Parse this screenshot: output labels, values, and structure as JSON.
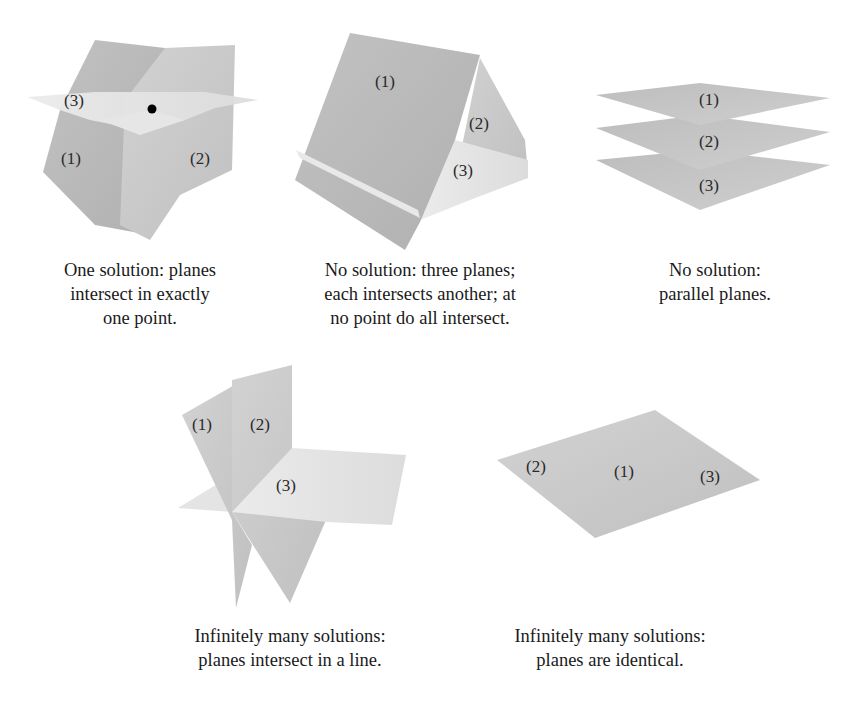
{
  "panels": [
    {
      "id": "one-solution",
      "plane_labels": [
        "(1)",
        "(2)",
        "(3)"
      ],
      "has_intersection_point": true,
      "caption_lines": [
        "One solution: planes",
        "intersect in exactly",
        "one point."
      ]
    },
    {
      "id": "no-solution-pairwise",
      "plane_labels": [
        "(1)",
        "(2)",
        "(3)"
      ],
      "caption_lines": [
        "No solution: three planes;",
        "each intersects another; at",
        "no point do all intersect."
      ]
    },
    {
      "id": "no-solution-parallel",
      "plane_labels": [
        "(1)",
        "(2)",
        "(3)"
      ],
      "caption_lines": [
        "No solution:",
        "parallel planes."
      ]
    },
    {
      "id": "infinite-line",
      "plane_labels": [
        "(1)",
        "(2)",
        "(3)"
      ],
      "caption_lines": [
        "Infinitely many solutions:",
        "planes intersect in a line."
      ]
    },
    {
      "id": "infinite-identical",
      "plane_labels": [
        "(2)",
        "(1)",
        "(3)"
      ],
      "caption_lines": [
        "Infinitely many solutions:",
        "planes are identical."
      ]
    }
  ],
  "colors": {
    "plane_dark": "#b9b9b9",
    "plane_mid": "#c8c8c8",
    "plane_light": "#dedede",
    "plane_lightest": "#ececec",
    "point": "#000000"
  }
}
